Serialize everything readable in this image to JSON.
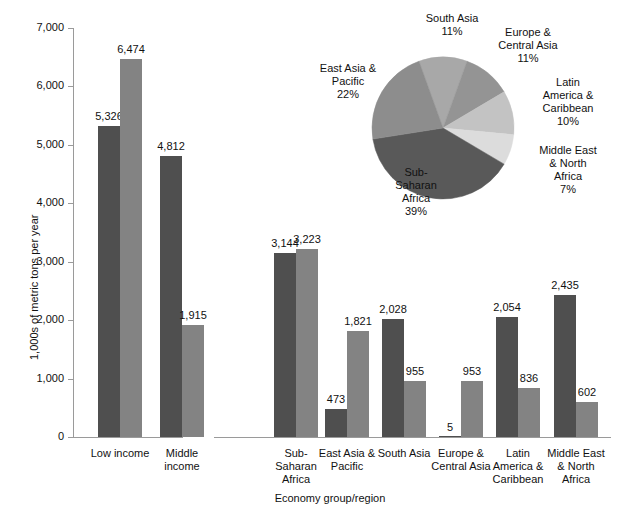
{
  "chart_data": [
    {
      "type": "bar",
      "title": "",
      "xlabel": "Economy group/region",
      "ylabel": "1,000s of metric tons per year",
      "ylim": [
        0,
        7000
      ],
      "ytick_labels": [
        "0",
        "1,000",
        "2,000",
        "3,000",
        "4,000",
        "5,000",
        "6,000",
        "7,000"
      ],
      "ytick_values": [
        0,
        1000,
        2000,
        3000,
        4000,
        5000,
        6000,
        7000
      ],
      "grid": false,
      "legend_position": "none",
      "categories": [
        "Low income",
        "Middle income",
        "Sub-Saharan Africa",
        "East Asia & Pacific",
        "South Asia",
        "Europe & Central Asia",
        "Latin America & Caribbean",
        "Middle East & North Africa"
      ],
      "category_label_lines": [
        [
          "Low income"
        ],
        [
          "Middle",
          "income"
        ],
        [
          "Sub-",
          "Saharan",
          "Africa"
        ],
        [
          "East Asia &",
          "Pacific"
        ],
        [
          "South Asia"
        ],
        [
          "Europe &",
          "Central Asia"
        ],
        [
          "Latin",
          "America &",
          "Caribbean"
        ],
        [
          "Middle East",
          "& North",
          "Africa"
        ]
      ],
      "series": [
        {
          "name": "series-1",
          "color": "#4f4f4f",
          "values": [
            5326,
            4812,
            3144,
            473,
            2028,
            5,
            2054,
            2435
          ],
          "labels": [
            "5,326",
            "4,812",
            "3,144",
            "473",
            "2,028",
            "5",
            "2,054",
            "2,435"
          ]
        },
        {
          "name": "series-2",
          "color": "#838383",
          "values": [
            6474,
            1915,
            3223,
            1821,
            955,
            953,
            836,
            602
          ],
          "labels": [
            "6,474",
            "1,915",
            "3,223",
            "1,821",
            "955",
            "953",
            "836",
            "602"
          ]
        }
      ]
    },
    {
      "type": "pie",
      "title": "",
      "labels": [
        "South Asia",
        "Europe & Central Asia",
        "Latin America & Caribbean",
        "Middle East & North Africa",
        "Sub-Saharan Africa",
        "East Asia & Pacific"
      ],
      "label_lines": [
        [
          "South Asia",
          "11%"
        ],
        [
          "Europe &",
          "Central Asia",
          "11%"
        ],
        [
          "Latin",
          "America &",
          "Caribbean",
          "10%"
        ],
        [
          "Middle East",
          "& North",
          "Africa",
          "7%"
        ],
        [
          "Sub-",
          "Saharan",
          "Africa",
          "39%"
        ],
        [
          "East Asia &",
          "Pacific",
          "22%"
        ]
      ],
      "values": [
        11,
        11,
        10,
        7,
        39,
        22
      ],
      "value_labels": [
        "11%",
        "11%",
        "10%",
        "7%",
        "39%",
        "22%"
      ],
      "colors": [
        "#a8a8a8",
        "#949494",
        "#c3c3c3",
        "#dcdcdc",
        "#595959",
        "#8d8d8d"
      ]
    }
  ],
  "axis": {
    "ylabel": "1,000s of metric tons per year",
    "xlabel": "Economy group/region",
    "yticks": [
      "7,000",
      "6,000",
      "5,000",
      "4,000",
      "3,000",
      "2,000",
      "1,000",
      "0"
    ]
  },
  "bar_value_labels": {
    "low_income_a": "5,326",
    "low_income_b": "6,474",
    "middle_income_a": "4,812",
    "middle_income_b": "1,915",
    "ssa_a": "3,144",
    "ssa_b": "3,223",
    "eap_a": "473",
    "eap_b": "1,821",
    "sa_a": "2,028",
    "sa_b": "955",
    "eca_a": "5",
    "eca_b": "953",
    "lac_a": "2,054",
    "lac_b": "836",
    "mena_a": "2,435",
    "mena_b": "602"
  },
  "xaxis_labels": {
    "low_income": [
      "Low income"
    ],
    "middle_income": [
      "Middle",
      "income"
    ],
    "ssa": [
      "Sub-",
      "Saharan",
      "Africa"
    ],
    "eap": [
      "East Asia &",
      "Pacific"
    ],
    "sa": [
      "South Asia"
    ],
    "eca": [
      "Europe &",
      "Central Asia"
    ],
    "lac": [
      "Latin",
      "America &",
      "Caribbean"
    ],
    "mena": [
      "Middle East",
      "& North",
      "Africa"
    ]
  },
  "pie_labels": {
    "south_asia": [
      "South Asia",
      "11%"
    ],
    "europe_central_asia": [
      "Europe &",
      "Central Asia",
      "11%"
    ],
    "latin_america": [
      "Latin",
      "America &",
      "Caribbean",
      "10%"
    ],
    "middle_east": [
      "Middle East",
      "& North",
      "Africa",
      "7%"
    ],
    "sub_saharan": [
      "Sub-",
      "Saharan",
      "Africa",
      "39%"
    ],
    "east_asia": [
      "East Asia &",
      "Pacific",
      "22%"
    ]
  },
  "colors": {
    "series_dark": "#4f4f4f",
    "series_light": "#838383",
    "axis": "#9a9a9a",
    "text": "#111111"
  }
}
